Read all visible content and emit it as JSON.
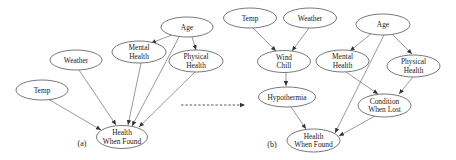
{
  "figure": {
    "panel_a": {
      "label": "(a)",
      "nodes": {
        "temp": {
          "lines": [
            "Temp"
          ]
        },
        "weather": {
          "lines": [
            "Weather"
          ]
        },
        "mental_health": {
          "lines": [
            "Mental",
            "Health"
          ]
        },
        "age": {
          "lines": [
            "Age"
          ]
        },
        "physical_health": {
          "lines": [
            "Physical",
            "Health"
          ]
        },
        "health_when_found": {
          "lines": [
            "Health",
            "When Found"
          ]
        }
      },
      "edges": [
        [
          "Age",
          "Mental Health"
        ],
        [
          "Age",
          "Physical Health"
        ],
        [
          "Age",
          "Health When Found"
        ],
        [
          "Temp",
          "Health When Found"
        ],
        [
          "Weather",
          "Health When Found"
        ],
        [
          "Mental Health",
          "Health When Found"
        ],
        [
          "Physical Health",
          "Health When Found"
        ]
      ]
    },
    "transition_arrow": "dashed",
    "panel_b": {
      "label": "(b)",
      "nodes": {
        "temp": {
          "lines": [
            "Temp"
          ]
        },
        "weather": {
          "lines": [
            "Weather"
          ]
        },
        "wind_chill": {
          "lines": [
            "Wind",
            "Chill"
          ]
        },
        "hypothermia": {
          "lines": [
            "Hypothermia"
          ]
        },
        "age": {
          "lines": [
            "Age"
          ]
        },
        "mental_health": {
          "lines": [
            "Mental",
            "Health"
          ]
        },
        "physical_health": {
          "lines": [
            "Physical",
            "Health"
          ]
        },
        "condition_when_lost": {
          "lines": [
            "Condition",
            "When Lost"
          ]
        },
        "health_when_found": {
          "lines": [
            "Health",
            "When Found"
          ]
        }
      },
      "edges": [
        [
          "Temp",
          "Wind Chill"
        ],
        [
          "Weather",
          "Wind Chill"
        ],
        [
          "Wind Chill",
          "Hypothermia"
        ],
        [
          "Hypothermia",
          "Health When Found"
        ],
        [
          "Age",
          "Mental Health"
        ],
        [
          "Age",
          "Physical Health"
        ],
        [
          "Age",
          "Health When Found"
        ],
        [
          "Mental Health",
          "Condition When Lost"
        ],
        [
          "Physical Health",
          "Condition When Lost"
        ],
        [
          "Condition When Lost",
          "Health When Found"
        ]
      ]
    }
  }
}
